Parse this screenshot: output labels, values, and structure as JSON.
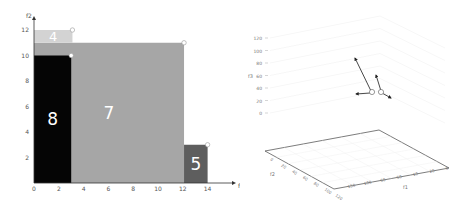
{
  "chart_data": [
    {
      "type": "bar",
      "subtype": "rectangles",
      "title": "",
      "xlabel": "f1",
      "ylabel": "f2",
      "xlim": [
        0,
        15
      ],
      "ylim": [
        0,
        12.5
      ],
      "xticks": [
        "0",
        "2",
        "4",
        "6",
        "8",
        "10",
        "12",
        "14"
      ],
      "yticks": [
        "2",
        "4",
        "6",
        "8",
        "10",
        "12"
      ],
      "grid": false,
      "rectangles": [
        {
          "label": "7",
          "x0": 0,
          "x1": 12.1,
          "y0": 0,
          "y1": 11,
          "color": "#a6a6a6",
          "corner_point": [
            12.1,
            11
          ]
        },
        {
          "label": "4",
          "x0": 0,
          "x1": 3.1,
          "y0": 11,
          "y1": 12,
          "color": "#d3d3d3",
          "corner_point": [
            3.1,
            12
          ]
        },
        {
          "label": "8",
          "x0": 0,
          "x1": 3.0,
          "y0": 0,
          "y1": 10,
          "color": "#050505",
          "corner_point": [
            3.0,
            10
          ]
        },
        {
          "label": "5",
          "x0": 12.1,
          "x1": 14.0,
          "y0": 0,
          "y1": 3,
          "color": "#5e5e5e",
          "corner_point": [
            14.0,
            3
          ]
        }
      ]
    },
    {
      "type": "scatter",
      "subtype": "3d-quiver",
      "title": "",
      "xlabel": "f1",
      "ylabel": "f2",
      "zlabel": "f3",
      "zticks": [
        "0",
        "20",
        "40",
        "60",
        "80",
        "100",
        "120"
      ],
      "f2_ticks": [
        "0",
        "20",
        "40",
        "60",
        "80",
        "100",
        "120"
      ],
      "f1_ticks": [
        "150",
        "100",
        "50",
        "50",
        "10",
        "20",
        "0"
      ],
      "grid": true,
      "points": [
        {
          "id": "p1",
          "arrows": [
            "up-left-long",
            "left-short"
          ]
        },
        {
          "id": "p2",
          "arrows": [
            "up-left-short",
            "down-right-short"
          ]
        }
      ]
    }
  ]
}
